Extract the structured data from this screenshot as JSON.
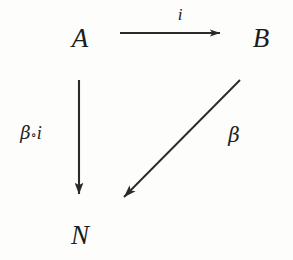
{
  "diagram": {
    "kind": "commutative-triangle",
    "background_color": "#fdfdfc",
    "ink_color": "#1c1c1c",
    "stroke_color": "#2a2a2a",
    "nodes": [
      {
        "id": "A",
        "label": "A",
        "x": 80,
        "y": 38
      },
      {
        "id": "B",
        "label": "B",
        "x": 261,
        "y": 38
      },
      {
        "id": "N",
        "label": "N",
        "x": 80,
        "y": 235
      }
    ],
    "edges": [
      {
        "id": "i",
        "label": "i",
        "from": "A",
        "to": "B",
        "label_x": 180,
        "label_y": 14,
        "x1": 120,
        "y1": 33,
        "x2": 231,
        "y2": 33
      },
      {
        "id": "beta-compose-i",
        "label_beta": "β",
        "label_op": "∘",
        "label_i": "i",
        "from": "A",
        "to": "N",
        "label_x": 31,
        "label_y": 133,
        "x1": 79,
        "y1": 80,
        "x2": 79,
        "y2": 205
      },
      {
        "id": "beta",
        "label": "β",
        "from": "B",
        "to": "N",
        "label_x": 234,
        "label_y": 135,
        "x1": 240,
        "y1": 80,
        "x2": 115,
        "y2": 206
      }
    ]
  }
}
